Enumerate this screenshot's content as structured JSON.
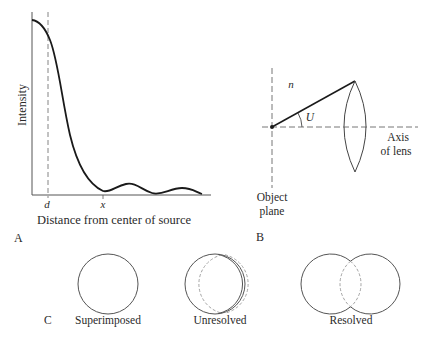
{
  "panel_a": {
    "panel_label": "A",
    "y_axis_label": "Intensity",
    "x_axis_label": "Distance from center of source",
    "tick_d": "d",
    "tick_x": "x"
  },
  "panel_b": {
    "panel_label": "B",
    "medium_label": "n",
    "angle_label": "U",
    "axis_label_line1": "Axis",
    "axis_label_line2": "of lens",
    "object_label_line1": "Object",
    "object_label_line2": "plane"
  },
  "panel_c": {
    "panel_label": "C",
    "cases": [
      {
        "label": "Superimposed"
      },
      {
        "label": "Unresolved"
      },
      {
        "label": "Resolved"
      }
    ]
  },
  "colors": {
    "ink": "#2a2a2a",
    "dashed": "#888888",
    "background": "#ffffff"
  }
}
